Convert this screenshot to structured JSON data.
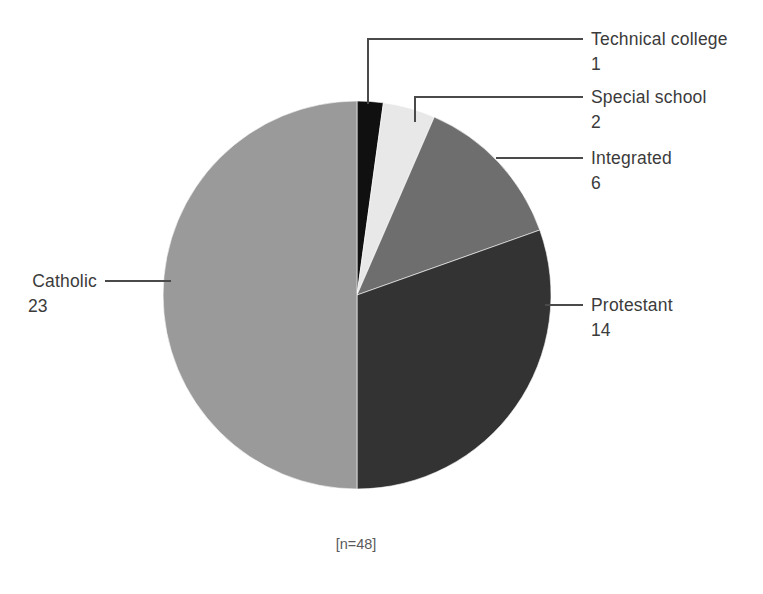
{
  "figure": {
    "footnote": "[n=48]",
    "background": "#ffffff"
  },
  "chart_data": {
    "type": "pie",
    "title": "",
    "xlabel": "",
    "ylabel": "",
    "total": 48,
    "footnote": "[n=48]",
    "legend_position": "callout-labels",
    "grid": false,
    "start_angle_deg": 0,
    "direction": "clockwise",
    "categories": [
      "Technical college",
      "Special school",
      "Integrated",
      "Protestant",
      "Catholic"
    ],
    "values": [
      1,
      2,
      6,
      14,
      23
    ],
    "colors": [
      "#101010",
      "#e8e8e8",
      "#6e6e6e",
      "#333333",
      "#9a9a9a"
    ],
    "slices": [
      {
        "label": "Technical college",
        "value": 1,
        "color": "#101010",
        "percent": 2.1
      },
      {
        "label": "Special school",
        "value": 2,
        "color": "#e8e8e8",
        "percent": 4.2
      },
      {
        "label": "Integrated",
        "value": 6,
        "color": "#6e6e6e",
        "percent": 12.5
      },
      {
        "label": "Protestant",
        "value": 14,
        "color": "#333333",
        "percent": 29.2
      },
      {
        "label": "Catholic",
        "value": 23,
        "color": "#9a9a9a",
        "percent": 47.9
      }
    ]
  },
  "callouts": {
    "technical_college": {
      "label": "Technical college",
      "value": "1"
    },
    "special_school": {
      "label": "Special school",
      "value": "2"
    },
    "integrated": {
      "label": "Integrated",
      "value": "6"
    },
    "protestant": {
      "label": "Protestant",
      "value": "14"
    },
    "catholic": {
      "label": "Catholic",
      "value": "23"
    }
  }
}
